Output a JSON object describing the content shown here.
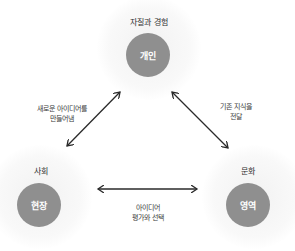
{
  "nodes": {
    "top": {
      "group_label": "자질과 경험",
      "label": "개인"
    },
    "left": {
      "group_label": "사회",
      "label": "현장"
    },
    "right": {
      "group_label": "문화",
      "label": "영역"
    }
  },
  "edges": {
    "left_top": {
      "line1": "새로운 아이디어를",
      "line2": "만들어냄"
    },
    "top_right": {
      "line1": "기존 지식을",
      "line2": "전달"
    },
    "left_right": {
      "line1": "아이디어",
      "line2": "평가와 선택"
    }
  },
  "colors": {
    "node_fill": "#8f8f8f",
    "node_text": "#ffffff",
    "arrow": "#2a2a2a",
    "halo": "#f2f2f2"
  }
}
